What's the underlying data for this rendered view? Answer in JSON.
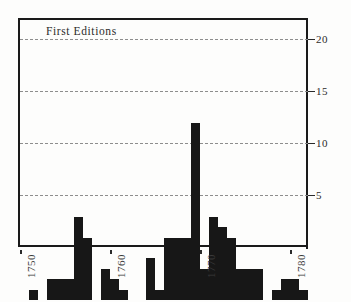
{
  "chart_data": {
    "type": "bar",
    "title": "First Editions",
    "xlabel": "",
    "ylabel": "",
    "xlim": [
      1749.5,
      1781.5
    ],
    "ylim": [
      0,
      22
    ],
    "grid": true,
    "grid_axis": "y",
    "grid_style": "dashed",
    "legend": "none",
    "bar_color": "#171717",
    "axis_color": "#1a1a1a",
    "gridline_color": "#8d8d8d",
    "y_ticks": [
      5,
      10,
      15,
      20
    ],
    "y_tick_labels": [
      "5",
      "10",
      "15",
      "20"
    ],
    "y_tick_side": "right",
    "x_ticks": [
      1750,
      1760,
      1770,
      1780
    ],
    "x_tick_labels": [
      "1750",
      "1760",
      "1770",
      "1780"
    ],
    "x_tick_label_rotation": 90,
    "categories": [
      "1750",
      "1751",
      "1752",
      "1753",
      "1754",
      "1755",
      "1756",
      "1757",
      "1758",
      "1759",
      "1760",
      "1761",
      "1762",
      "1763",
      "1764",
      "1765",
      "1766",
      "1767",
      "1768",
      "1769",
      "1770",
      "1771",
      "1772",
      "1773",
      "1774",
      "1775",
      "1776",
      "1777",
      "1778",
      "1779",
      "1780",
      "1781"
    ],
    "values": [
      0,
      1,
      0,
      2,
      2,
      2,
      8,
      6,
      0,
      3,
      2,
      1,
      0,
      0,
      4,
      1,
      6,
      6,
      6,
      17,
      3,
      8,
      7,
      6,
      3,
      3,
      3,
      0,
      1,
      2,
      2,
      1
    ]
  },
  "figure": {
    "caption_text": "First Editions"
  }
}
